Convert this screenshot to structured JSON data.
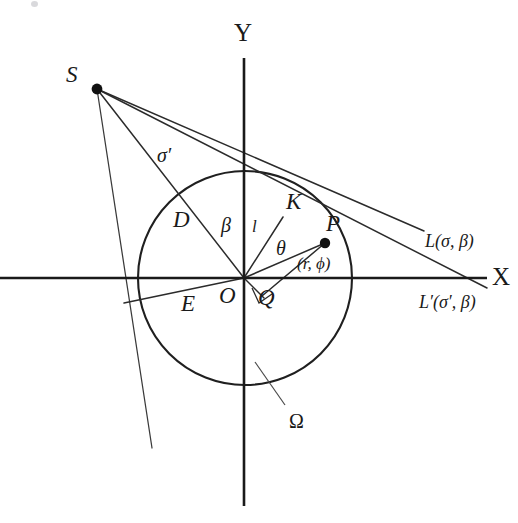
{
  "figure": {
    "type": "geometry-diagram",
    "background_color": "#ffffff",
    "ink_color": "#1a1a1a"
  },
  "axes": {
    "x_label": "X",
    "y_label": "Y",
    "origin_label": "O",
    "x_axis": {
      "x1": 0,
      "y1": 278,
      "x2": 487,
      "y2": 278
    },
    "y_axis": {
      "x1": 244,
      "y1": 58,
      "x2": 244,
      "y2": 506
    },
    "x_label_pos": {
      "x": 492,
      "y": 264
    },
    "y_label_pos": {
      "x": 234,
      "y": 20
    },
    "origin_label_pos": {
      "x": 219,
      "y": 284
    }
  },
  "circle": {
    "name": "Omega",
    "label": "Ω",
    "cx": 245,
    "cy": 278,
    "r": 107,
    "label_pos": {
      "x": 289,
      "y": 411
    },
    "leader": {
      "x1": 285,
      "y1": 407,
      "x2": 256,
      "y2": 364
    }
  },
  "points": [
    {
      "id": "S",
      "label": "S",
      "x": 97,
      "y": 89,
      "dot": true,
      "dot_r": 5.4,
      "label_pos": {
        "x": 66,
        "y": 63
      }
    },
    {
      "id": "P",
      "label": "P",
      "x": 325,
      "y": 243,
      "dot": true,
      "dot_r": 5.2,
      "label_pos": {
        "x": 326,
        "y": 212
      }
    },
    {
      "id": "K",
      "label": "K",
      "x": 283,
      "y": 217,
      "dot": false,
      "label_pos": {
        "x": 286,
        "y": 190
      }
    },
    {
      "id": "Q",
      "label": "Q",
      "x": 262,
      "y": 296,
      "dot": false,
      "label_pos": {
        "x": 258,
        "y": 286
      }
    },
    {
      "id": "O",
      "label": "O",
      "x": 244,
      "y": 278,
      "dot": false,
      "label_pos": {
        "x": 219,
        "y": 284
      }
    }
  ],
  "segment_labels": [
    {
      "id": "sigma-prime",
      "label": "σ′",
      "x": 157,
      "y": 145
    },
    {
      "id": "D",
      "label": "D",
      "x": 173,
      "y": 208
    },
    {
      "id": "beta",
      "label": "β",
      "x": 221,
      "y": 215
    },
    {
      "id": "l",
      "label": "l",
      "x": 252,
      "y": 218
    },
    {
      "id": "theta",
      "label": "θ",
      "x": 276,
      "y": 238
    },
    {
      "id": "E",
      "label": "E",
      "x": 181,
      "y": 292
    },
    {
      "id": "polar-coords",
      "label": "(r, ϕ)",
      "x": 297,
      "y": 255
    }
  ],
  "line_labels": [
    {
      "id": "L",
      "label": "L(σ, β)",
      "x": 425,
      "y": 232
    },
    {
      "id": "L-prime",
      "label": "L′(σ′, β)",
      "x": 419,
      "y": 293
    }
  ],
  "rays_from_source": [
    {
      "id": "ray-S-to-L",
      "from": "S",
      "note": "upper ray to L(sigma, beta)",
      "x1": 97,
      "y1": 89,
      "x2": 424,
      "y2": 231
    },
    {
      "id": "ray-S-through-P",
      "from": "S",
      "note": "ray through K and P continuing to L-prime",
      "x1": 97,
      "y1": 89,
      "x2": 487,
      "y2": 288
    },
    {
      "id": "ray-S-to-O",
      "from": "S",
      "note": "ray S to origin O labeled D",
      "x1": 97,
      "y1": 89,
      "x2": 244,
      "y2": 278
    },
    {
      "id": "ray-S-steep",
      "from": "S",
      "note": "steep ray descending past circle to lower left",
      "x1": 97,
      "y1": 89,
      "x2": 152,
      "y2": 448
    }
  ],
  "other_segments": [
    {
      "id": "seg-O-K",
      "label": "l",
      "x1": 244,
      "y1": 278,
      "x2": 283,
      "y2": 217
    },
    {
      "id": "seg-O-P",
      "label": "r",
      "x1": 244,
      "y1": 278,
      "x2": 325,
      "y2": 243
    },
    {
      "id": "seg-O-Q",
      "x1": 244,
      "y1": 278,
      "x2": 262,
      "y2": 296
    },
    {
      "id": "seg-Q-P",
      "x1": 262,
      "y1": 296,
      "x2": 325,
      "y2": 243
    },
    {
      "id": "seg-L-prime-left",
      "note": "L-prime extended to lower left through E",
      "x1": 244,
      "y1": 278,
      "x2": 124,
      "y2": 303
    }
  ],
  "right_angle_marker": {
    "at": "Q",
    "x": 262,
    "y": 296,
    "size": 12
  },
  "angle_arcs": [
    {
      "id": "arc-beta",
      "center": "O",
      "label": "β"
    },
    {
      "id": "arc-theta",
      "center": "O",
      "label": "θ"
    }
  ]
}
